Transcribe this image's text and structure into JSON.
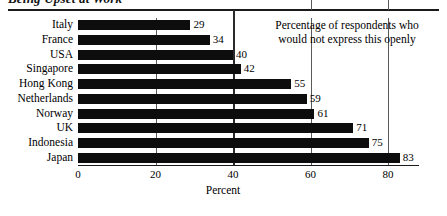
{
  "chart_data": {
    "type": "bar",
    "orientation": "horizontal",
    "title": "Being Upset at Work",
    "categories": [
      "Italy",
      "France",
      "USA",
      "Singapore",
      "Hong Kong",
      "Netherlands",
      "Norway",
      "UK",
      "Indonesia",
      "Japan"
    ],
    "values": [
      29,
      34,
      40,
      42,
      55,
      59,
      61,
      71,
      75,
      83
    ],
    "xlabel": "Percent",
    "ylabel": "",
    "xlim": [
      0,
      88
    ],
    "xticks": [
      "0",
      "20",
      "40",
      "60",
      "80"
    ],
    "xtick_values": [
      0,
      20,
      40,
      60,
      80
    ],
    "grid": true,
    "grid_axis": "x",
    "legend": "none",
    "bar_color": "#0d0d0d",
    "annotation_lines": [
      "Percentage of respondents who",
      "would not express this openly"
    ]
  },
  "chart": {
    "title": "Being Upset at Work",
    "xlabel": "Percent",
    "annotation": {
      "line1": "Percentage of respondents who",
      "line2": "would not express this openly"
    }
  }
}
